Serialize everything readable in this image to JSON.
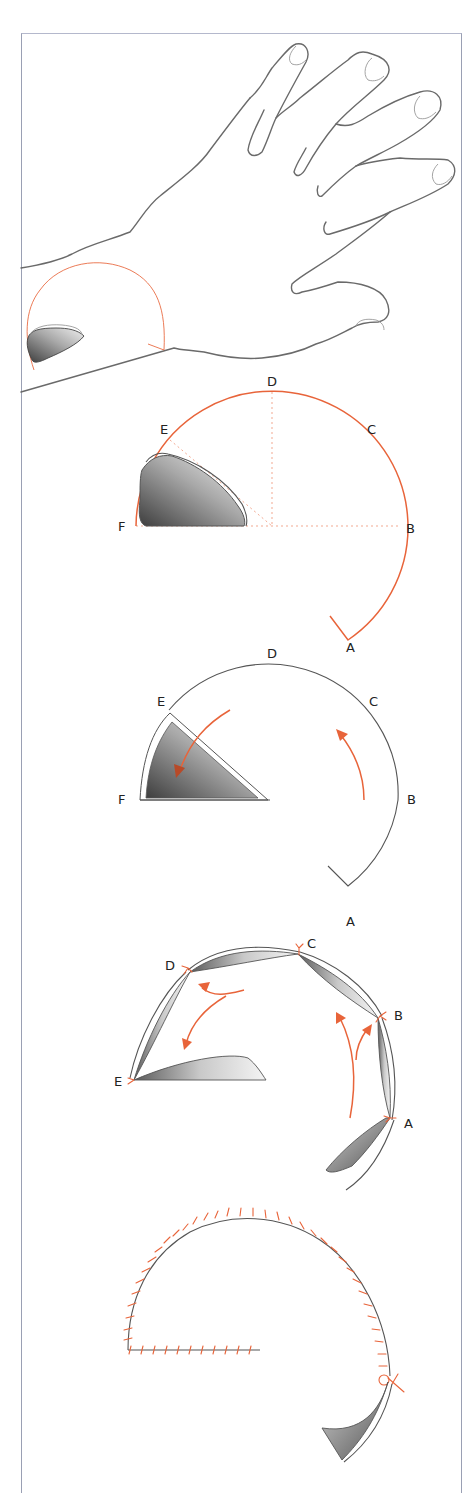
{
  "figure": {
    "type": "surgical-technique-illustration",
    "colors": {
      "accent": "#e8643a",
      "outline": "#6a6a6a",
      "frame": "#9aa0b4",
      "defect_shade_dark": "#4a4a4a",
      "defect_shade_light": "#f2f2f2"
    },
    "panels": [
      {
        "step": 1,
        "name": "hand-overview",
        "description": "Dorsum of hand with defect near wrist and planned semicircular flap outline"
      },
      {
        "step": 2,
        "name": "flap-design",
        "labels": {
          "A": "A",
          "B": "B",
          "C": "C",
          "D": "D",
          "E": "E",
          "F": "F"
        },
        "description": "Circular flap outline with guide lines from center to points B, D, E"
      },
      {
        "step": 3,
        "name": "defect-triangulated",
        "labels": {
          "A": "A",
          "B": "B",
          "C": "C",
          "D": "D",
          "E": "E",
          "F": "F"
        },
        "description": "Defect converted to triangle; arrows indicate rotation direction"
      },
      {
        "step": 4,
        "name": "flap-rotation",
        "labels": {
          "A": "A",
          "B": "B",
          "C": "C",
          "D": "D",
          "E": "E"
        },
        "description": "Flap incised and rotated; tacking sutures at A, B, C, D, E"
      },
      {
        "step": 5,
        "name": "closure-complete",
        "description": "Final closure with interrupted sutures along arc and base; dog-ear at A"
      }
    ]
  }
}
